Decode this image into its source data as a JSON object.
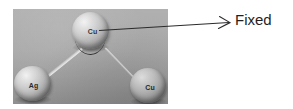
{
  "figure": {
    "type": "molecular-structure-diagram",
    "background_color": "#ffffff"
  },
  "photo": {
    "background_color": "#a9a9a9",
    "atoms": [
      {
        "id": "cu-top",
        "label": "Cu",
        "position": "top-center"
      },
      {
        "id": "ag",
        "label": "Ag",
        "position": "bottom-left"
      },
      {
        "id": "cu-right",
        "label": "Cu",
        "position": "bottom-right"
      }
    ],
    "bonds": [
      {
        "id": "bond-ag",
        "from": "cu-top",
        "to": "ag"
      },
      {
        "id": "bond-cu",
        "from": "cu-top",
        "to": "cu-right"
      }
    ],
    "angle_marker": {
      "at": "cu-top",
      "color": "#2b2b2b"
    }
  },
  "annotation": {
    "label": "Fixed",
    "label_color": "#1f1f1f",
    "arrow_color": "#2b2b2b",
    "points_to": "cu-top",
    "arrowhead_style": "open-v"
  }
}
